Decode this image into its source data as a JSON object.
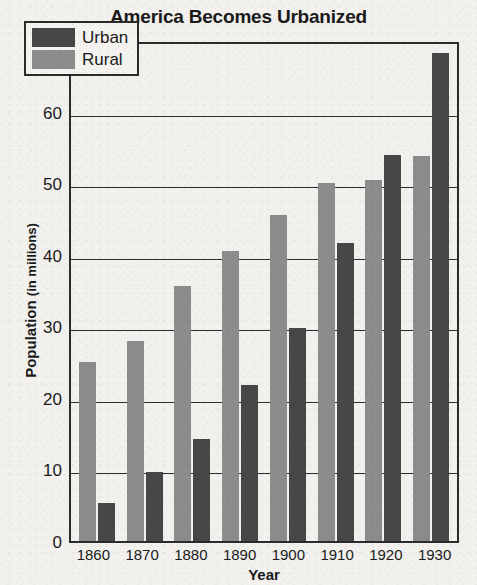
{
  "chart_data": {
    "type": "bar",
    "title": "America Becomes Urbanized",
    "xlabel": "Year",
    "ylabel": "Population (in millions)",
    "ylabel_main": "Population",
    "ylabel_unit": "(in millions)",
    "categories": [
      "1860",
      "1870",
      "1880",
      "1890",
      "1900",
      "1910",
      "1920",
      "1930"
    ],
    "series": [
      {
        "name": "Rural",
        "color": "#8c8c8c",
        "values": [
          25.0,
          28.0,
          35.6,
          40.5,
          45.5,
          50.0,
          50.4,
          53.8
        ]
      },
      {
        "name": "Urban",
        "color": "#474747",
        "values": [
          5.3,
          9.6,
          14.3,
          21.8,
          29.7,
          41.6,
          54.0,
          68.2
        ]
      }
    ],
    "series_order_in_group": [
      "Rural",
      "Urban"
    ],
    "ylim": [
      0,
      70
    ],
    "yticks": [
      70,
      60,
      50,
      40,
      30,
      20,
      10,
      0
    ],
    "grid": true,
    "legend_position": "top-left",
    "legend_entries": [
      {
        "label": "Urban",
        "color": "#474747"
      },
      {
        "label": "Rural",
        "color": "#8c8c8c"
      }
    ]
  }
}
